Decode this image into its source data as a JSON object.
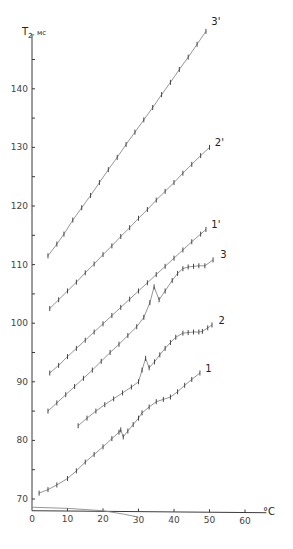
{
  "chart_data": {
    "type": "line",
    "title": "",
    "xlabel": "°C",
    "ylabel": "T₂, мс",
    "xlim": [
      0,
      65
    ],
    "ylim": [
      68,
      148
    ],
    "xticks": [
      0,
      10,
      20,
      30,
      40,
      50,
      60
    ],
    "yticks": [
      70,
      80,
      90,
      100,
      110,
      120,
      130,
      140
    ],
    "yminor": [
      75,
      85,
      95,
      105,
      115,
      125,
      135,
      145
    ],
    "grid": false,
    "legend": "inline labels at curve ends",
    "series": [
      {
        "name": "3'",
        "label_pos": [
          50.5,
          151.5
        ],
        "points": [
          [
            4.5,
            111.5
          ],
          [
            7,
            113.5
          ],
          [
            9,
            115.2
          ],
          [
            11.5,
            117.6
          ],
          [
            14,
            119.7
          ],
          [
            16.5,
            121.8
          ],
          [
            19,
            124
          ],
          [
            21.5,
            126.2
          ],
          [
            24,
            128.3
          ],
          [
            26.5,
            130.5
          ],
          [
            29,
            132.6
          ],
          [
            31.5,
            134.7
          ],
          [
            34,
            136.8
          ],
          [
            36.5,
            139
          ],
          [
            39,
            141.1
          ],
          [
            41.5,
            143.3
          ],
          [
            44,
            145.4
          ],
          [
            46.5,
            147.6
          ],
          [
            49,
            149.8
          ]
        ]
      },
      {
        "name": "2'",
        "label_pos": [
          51.5,
          131
        ],
        "points": [
          [
            5,
            102.5
          ],
          [
            7.5,
            104
          ],
          [
            10,
            105.5
          ],
          [
            12.5,
            107
          ],
          [
            15,
            108.6
          ],
          [
            17.5,
            110.1
          ],
          [
            20,
            111.7
          ],
          [
            22.5,
            113.2
          ],
          [
            25,
            114.8
          ],
          [
            27.5,
            116.3
          ],
          [
            30,
            117.9
          ],
          [
            32.5,
            119.4
          ],
          [
            35,
            121
          ],
          [
            37.5,
            122.5
          ],
          [
            40,
            124
          ],
          [
            42.5,
            125.6
          ],
          [
            45,
            127.1
          ],
          [
            47.5,
            128.6
          ],
          [
            50,
            130
          ]
        ]
      },
      {
        "name": "1'",
        "label_pos": [
          50.5,
          117
        ],
        "points": [
          [
            5,
            91.5
          ],
          [
            7.5,
            92.8
          ],
          [
            10,
            94.3
          ],
          [
            12.5,
            95.7
          ],
          [
            15,
            97.1
          ],
          [
            17.5,
            98.5
          ],
          [
            20,
            99.9
          ],
          [
            22.5,
            101.3
          ],
          [
            25,
            102.7
          ],
          [
            27.5,
            104.1
          ],
          [
            30,
            105.5
          ],
          [
            32.5,
            106.9
          ],
          [
            35,
            108.3
          ],
          [
            37.5,
            109.7
          ],
          [
            40,
            111.1
          ],
          [
            42.5,
            112.5
          ],
          [
            45,
            113.9
          ],
          [
            47.5,
            115.2
          ],
          [
            49,
            116
          ]
        ]
      },
      {
        "name": "3",
        "label_pos": [
          53,
          111.8
        ],
        "points": [
          [
            4.5,
            85
          ],
          [
            7,
            86.4
          ],
          [
            9.5,
            87.8
          ],
          [
            12,
            89.2
          ],
          [
            14.5,
            90.6
          ],
          [
            17,
            92
          ],
          [
            19.5,
            93.5
          ],
          [
            22,
            95
          ],
          [
            24.5,
            96.4
          ],
          [
            27,
            97.9
          ],
          [
            29.5,
            99.4
          ],
          [
            31.5,
            101
          ],
          [
            33.2,
            103.5
          ],
          [
            34.4,
            106.2
          ],
          [
            35.8,
            104
          ],
          [
            37.5,
            105.5
          ],
          [
            39.5,
            107.3
          ],
          [
            41,
            108.5
          ],
          [
            42.5,
            109.3
          ],
          [
            44,
            109.6
          ],
          [
            45.5,
            109.7
          ],
          [
            47,
            109.8
          ],
          [
            48.7,
            109.8
          ],
          [
            51,
            110.8
          ]
        ]
      },
      {
        "name": "2",
        "label_pos": [
          52.5,
          100.5
        ],
        "points": [
          [
            13,
            82.5
          ],
          [
            15.5,
            83.8
          ],
          [
            18,
            85
          ],
          [
            20.5,
            86.1
          ],
          [
            23,
            87.1
          ],
          [
            25.5,
            88.1
          ],
          [
            28,
            89.1
          ],
          [
            30,
            90
          ],
          [
            31,
            92
          ],
          [
            32,
            94
          ],
          [
            33,
            92.4
          ],
          [
            34.5,
            93.4
          ],
          [
            36,
            94.6
          ],
          [
            37.5,
            95.7
          ],
          [
            39,
            96.7
          ],
          [
            40.5,
            97.6
          ],
          [
            42.5,
            98.3
          ],
          [
            44,
            98.4
          ],
          [
            45.5,
            98.5
          ],
          [
            47,
            98.5
          ],
          [
            48,
            98.6
          ],
          [
            49.5,
            99.2
          ],
          [
            50.7,
            99.7
          ]
        ]
      },
      {
        "name": "1",
        "label_pos": [
          48.8,
          92.4
        ],
        "points": [
          [
            2,
            71
          ],
          [
            4.5,
            71.6
          ],
          [
            7,
            72.4
          ],
          [
            10,
            73.5
          ],
          [
            12.5,
            74.8
          ],
          [
            15,
            76.3
          ],
          [
            17.5,
            77.6
          ],
          [
            20,
            78.9
          ],
          [
            22.5,
            80.3
          ],
          [
            24.5,
            81.4
          ],
          [
            25,
            81.8
          ],
          [
            25.7,
            80.6
          ],
          [
            27,
            81.6
          ],
          [
            28.5,
            82.7
          ],
          [
            30,
            83.8
          ],
          [
            31,
            84.7
          ],
          [
            33,
            85.7
          ],
          [
            35,
            86.6
          ],
          [
            37,
            87
          ],
          [
            39,
            87.4
          ],
          [
            41,
            88.3
          ],
          [
            43,
            89.4
          ],
          [
            45,
            90.4
          ],
          [
            47.3,
            91.5
          ]
        ]
      }
    ],
    "baseline": {
      "name": "baseline",
      "points": [
        [
          0,
          68.6
        ],
        [
          10,
          68.4
        ],
        [
          20,
          68.0
        ],
        [
          26,
          67.4
        ],
        [
          30,
          66.9
        ]
      ]
    }
  },
  "axis": {
    "x_unit": "°C",
    "y_symbol": "T",
    "y_sub": "2",
    "y_unit": "мс"
  }
}
